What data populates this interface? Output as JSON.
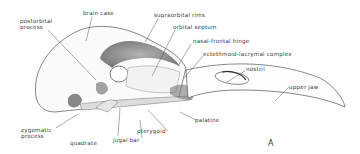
{
  "figure": {
    "panel_letter": "A",
    "labels": {
      "postorbital_process": "postorbital process",
      "brain_case": "brain case",
      "supraorbital_rims": "supraorbital rims",
      "orbital_septum": "orbital septum",
      "nasal_frontal_hinge": "nasal-frontal hinge",
      "ectethmoid_lacrymal_complex": "ectethmoid-lacrymal complex",
      "nostril": "nostril",
      "upper_jaw": "upper jaw",
      "palatine": "palatine",
      "pterygoid": "pterygoid",
      "jugal_bar": "jugal bar",
      "quadrate": "quadrate",
      "zygomatic_process": "zygomatic process"
    }
  }
}
